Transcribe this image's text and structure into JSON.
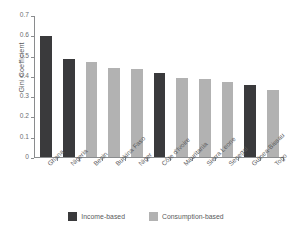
{
  "chart_data": {
    "type": "bar",
    "title": "",
    "xlabel": "",
    "ylabel": "Gini Coefficient",
    "ylim": [
      0,
      0.7
    ],
    "ytick_labels": [
      "0.7",
      "0.6",
      "0.5",
      "0.4",
      "0.3",
      "0.2",
      "0.1",
      "0"
    ],
    "ytick_values": [
      0.7,
      0.6,
      0.5,
      0.4,
      0.3,
      0.2,
      0.1,
      0
    ],
    "grid": false,
    "legend_position": "bottom",
    "categories": [
      "Ghana",
      "Nigeria",
      "Benin",
      "Burkina Faso",
      "Niger",
      "Côte d'Ivoire",
      "Mauritania",
      "Sierra Leone",
      "Senegal",
      "Guinea-Bissau",
      "Togo"
    ],
    "values": [
      0.601,
      0.488,
      0.47,
      0.441,
      0.437,
      0.419,
      0.39,
      0.387,
      0.371,
      0.357,
      0.333
    ],
    "point_types": [
      "income",
      "income",
      "consumption",
      "consumption",
      "consumption",
      "income",
      "consumption",
      "consumption",
      "consumption",
      "income",
      "consumption"
    ],
    "series": [
      {
        "name": "Income-based",
        "color": "#3a3a3c",
        "points": [
          {
            "category": "Ghana",
            "value": 0.601
          },
          {
            "category": "Nigeria",
            "value": 0.488
          },
          {
            "category": "Côte d'Ivoire",
            "value": 0.419
          },
          {
            "category": "Guinea-Bissau",
            "value": 0.357
          }
        ]
      },
      {
        "name": "Consumption-based",
        "color": "#b2b2b2",
        "points": [
          {
            "category": "Benin",
            "value": 0.47
          },
          {
            "category": "Burkina Faso",
            "value": 0.441
          },
          {
            "category": "Niger",
            "value": 0.437
          },
          {
            "category": "Mauritania",
            "value": 0.39
          },
          {
            "category": "Sierra Leone",
            "value": 0.387
          },
          {
            "category": "Senegal",
            "value": 0.371
          },
          {
            "category": "Togo",
            "value": 0.333
          }
        ]
      }
    ]
  },
  "legend": {
    "items": [
      {
        "label": "Income-based",
        "color": "#3a3a3c"
      },
      {
        "label": "Consumption-based",
        "color": "#b2b2b2"
      }
    ]
  },
  "colors": {
    "income": "#3a3a3c",
    "consumption": "#b2b2b2",
    "axis": "#8a8c8e",
    "text": "#58595b",
    "background": "#ffffff"
  }
}
